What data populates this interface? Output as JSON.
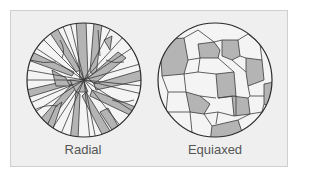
{
  "figure": {
    "panels": [
      {
        "id": "radial",
        "label": "Radial"
      },
      {
        "id": "equiaxed",
        "label": "Equiaxed"
      }
    ],
    "colors": {
      "background": "#efefef",
      "grain_shaded": "#b4b4b4",
      "grain_light": "#f4f4f4",
      "boundary": "#3a3a3a",
      "label_text": "#555555"
    }
  }
}
